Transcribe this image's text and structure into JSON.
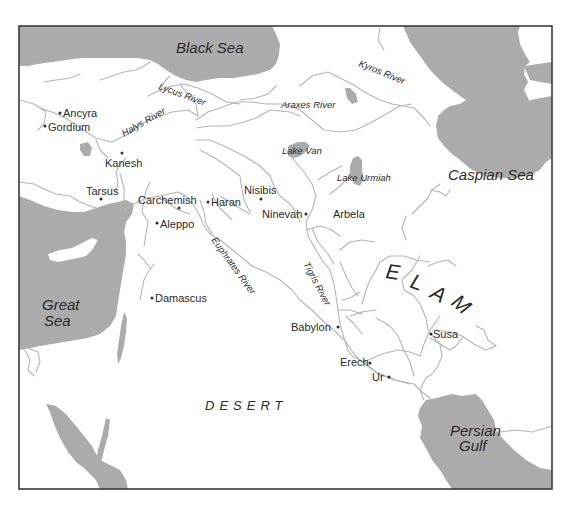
{
  "map": {
    "seas": [
      {
        "id": "black-sea",
        "label": "Black Sea"
      },
      {
        "id": "caspian-sea",
        "label": "Caspian Sea"
      },
      {
        "id": "great-sea",
        "label_line1": "Great",
        "label_line2": "Sea"
      },
      {
        "id": "persian-gulf",
        "label_line1": "Persian",
        "label_line2": "Gulf"
      }
    ],
    "lakes": [
      {
        "id": "lake-van",
        "label": "Lake Van"
      },
      {
        "id": "lake-urmiah",
        "label": "Lake Urmiah"
      }
    ],
    "rivers": [
      {
        "id": "lycus-river",
        "label": "Lycus River"
      },
      {
        "id": "halys-river",
        "label": "Halys River"
      },
      {
        "id": "araxes-river",
        "label": "Araxes River"
      },
      {
        "id": "kyros-river",
        "label": "Kyros River"
      },
      {
        "id": "euphrates-river",
        "label": "Euphrates River"
      },
      {
        "id": "tigris-river",
        "label": "Tigris River"
      }
    ],
    "cities": [
      {
        "id": "ancyra",
        "label": "Ancyra"
      },
      {
        "id": "gordium",
        "label": "Gordium"
      },
      {
        "id": "kanesh",
        "label": "Kanesh"
      },
      {
        "id": "tarsus",
        "label": "Tarsus"
      },
      {
        "id": "carchemish",
        "label": "Carchemish"
      },
      {
        "id": "aleppo",
        "label": "Aleppo"
      },
      {
        "id": "haran",
        "label": "Haran"
      },
      {
        "id": "nisibis",
        "label": "Nisibis"
      },
      {
        "id": "ninevah",
        "label": "Ninevah"
      },
      {
        "id": "arbela",
        "label": "Arbela"
      },
      {
        "id": "damascus",
        "label": "Damascus"
      },
      {
        "id": "babylon",
        "label": "Babylon"
      },
      {
        "id": "erech",
        "label": "Erech"
      },
      {
        "id": "ur",
        "label": "Ur"
      },
      {
        "id": "susa",
        "label": "Susa"
      }
    ],
    "regions": [
      {
        "id": "desert",
        "label": "DESERT"
      },
      {
        "id": "elam",
        "letters": [
          "E",
          "L",
          "A",
          "M"
        ]
      }
    ],
    "colors": {
      "water": "#ababab",
      "river": "#b4b4b4",
      "text": "#2a2a2a",
      "frame": "#3a3a3a",
      "land": "#ffffff"
    }
  }
}
